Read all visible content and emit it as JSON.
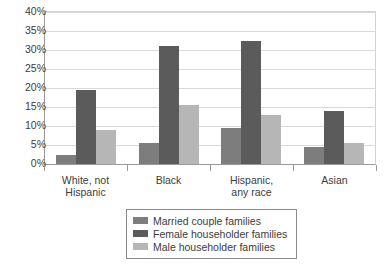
{
  "chart_data": {
    "type": "bar",
    "title": "",
    "subtitle": "",
    "xlabel": "",
    "ylabel": "",
    "categories": [
      "White, not Hispanic",
      "Black",
      "Hispanic, any race",
      "Asian"
    ],
    "category_lines": [
      [
        "White, not",
        "Hispanic"
      ],
      [
        "Black"
      ],
      [
        "Hispanic,",
        "any race"
      ],
      [
        "Asian"
      ]
    ],
    "series": [
      {
        "name": "Married couple families",
        "values": [
          2.5,
          5.5,
          9.5,
          4.5
        ],
        "color": "#7d7d7d"
      },
      {
        "name": "Female householder families",
        "values": [
          19.5,
          31.0,
          32.5,
          14.0
        ],
        "color": "#5b5b5b"
      },
      {
        "name": "Male householder families",
        "values": [
          9.0,
          15.5,
          13.0,
          5.5
        ],
        "color": "#b6b6b6"
      }
    ],
    "ylim": [
      0,
      40
    ],
    "ytick_step": 5,
    "ytick_labels": [
      "40%",
      "35%",
      "30%",
      "25%",
      "20%",
      "15%",
      "10%",
      "5%",
      "0%"
    ],
    "ytick_values": [
      40,
      35,
      30,
      25,
      20,
      15,
      10,
      5,
      0
    ],
    "grid": true,
    "grid_axis": "y",
    "legend_position": "bottom"
  },
  "legend": {
    "items": [
      {
        "label": "Married couple families",
        "color": "#7d7d7d"
      },
      {
        "label": "Female householder families",
        "color": "#5b5b5b"
      },
      {
        "label": "Male householder families",
        "color": "#b6b6b6"
      }
    ]
  }
}
